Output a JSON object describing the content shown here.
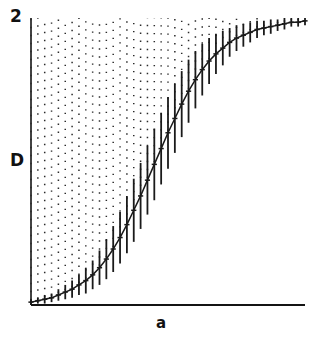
{
  "chart_data": {
    "type": "line",
    "title": "",
    "xlabel": "a",
    "ylabel": "D",
    "ytick_labels": [
      "2"
    ],
    "xtick_labels": [],
    "grid": false,
    "legend": null,
    "xlim": [
      0,
      1
    ],
    "ylim": [
      0,
      2
    ],
    "series": [
      {
        "name": "D",
        "marker": "tick",
        "line_style": "solid",
        "color": "#1a1a1a",
        "x": [
          0.0,
          0.025,
          0.05,
          0.075,
          0.1,
          0.125,
          0.15,
          0.175,
          0.2,
          0.225,
          0.25,
          0.275,
          0.3,
          0.325,
          0.35,
          0.375,
          0.4,
          0.425,
          0.45,
          0.475,
          0.5,
          0.525,
          0.55,
          0.575,
          0.6,
          0.625,
          0.65,
          0.675,
          0.7,
          0.725,
          0.75,
          0.775,
          0.8,
          0.825,
          0.85,
          0.875,
          0.9,
          0.925,
          0.95,
          0.975,
          1.0
        ],
        "y": [
          0.02,
          0.03,
          0.04,
          0.05,
          0.07,
          0.09,
          0.11,
          0.14,
          0.17,
          0.21,
          0.26,
          0.32,
          0.39,
          0.47,
          0.56,
          0.66,
          0.76,
          0.87,
          0.98,
          1.09,
          1.2,
          1.3,
          1.4,
          1.49,
          1.57,
          1.64,
          1.7,
          1.75,
          1.79,
          1.83,
          1.86,
          1.88,
          1.9,
          1.92,
          1.93,
          1.94,
          1.95,
          1.96,
          1.97,
          1.97,
          1.98
        ],
        "yerr": [
          0.02,
          0.02,
          0.03,
          0.03,
          0.04,
          0.05,
          0.06,
          0.07,
          0.09,
          0.1,
          0.12,
          0.14,
          0.16,
          0.18,
          0.2,
          0.22,
          0.23,
          0.24,
          0.25,
          0.25,
          0.25,
          0.24,
          0.23,
          0.22,
          0.2,
          0.18,
          0.16,
          0.14,
          0.12,
          0.1,
          0.09,
          0.08,
          0.07,
          0.06,
          0.05,
          0.05,
          0.04,
          0.04,
          0.03,
          0.03,
          0.03
        ]
      }
    ],
    "dotted_columns": {
      "style": "dotted",
      "color": "#2b2b2b",
      "top_value": 2.0,
      "note": "Vertical dotted lines drawn from each curve point up to D = 2."
    }
  },
  "axes": {
    "y_top_label": "2",
    "y_axis_label": "D",
    "x_axis_label": "a"
  },
  "colors": {
    "ink": "#111111",
    "curve": "#1a1a1a",
    "dots": "#2b2b2b",
    "background": "#ffffff"
  }
}
